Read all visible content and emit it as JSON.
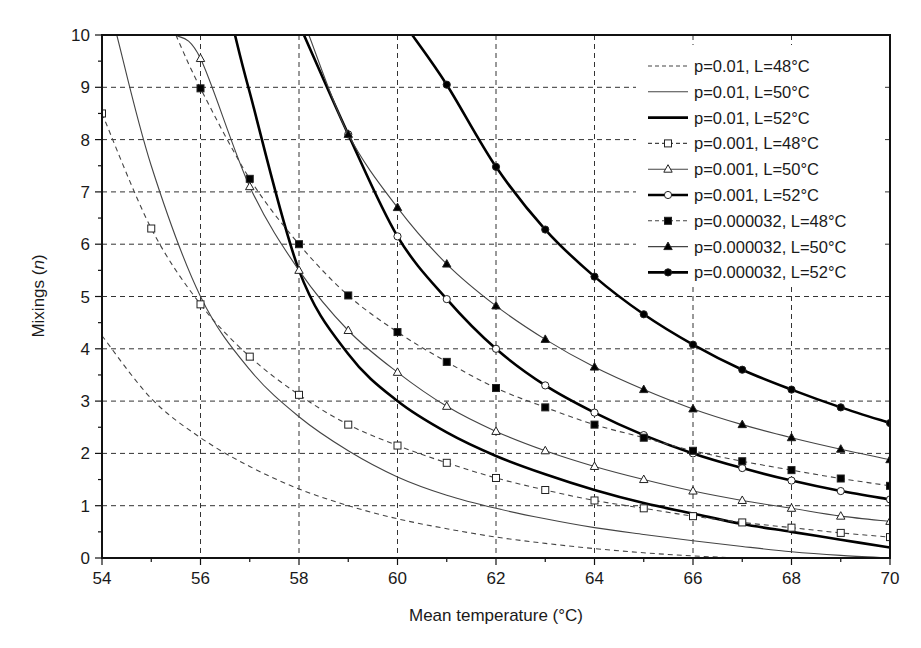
{
  "chart_data": {
    "type": "line",
    "title": "",
    "xlabel": "Mean temperature (°C)",
    "ylabel": "Mixings (n)",
    "xlim": [
      54,
      70
    ],
    "ylim": [
      0,
      10
    ],
    "xticks": [
      54,
      56,
      58,
      60,
      62,
      64,
      66,
      68,
      70
    ],
    "yticks": [
      0,
      1,
      2,
      3,
      4,
      5,
      6,
      7,
      8,
      9,
      10
    ],
    "grid": true,
    "legend_position": "upper right",
    "series": [
      {
        "name": "p=0.01, L=48°C",
        "style": "dashed",
        "weight": "thin",
        "marker": "none",
        "x": [
          54,
          55,
          56,
          57,
          58,
          59,
          60,
          61,
          62,
          63,
          64,
          65,
          66,
          67,
          68,
          69,
          70
        ],
        "y": [
          4.25,
          3.05,
          2.3,
          1.75,
          1.32,
          1.0,
          0.75,
          0.56,
          0.4,
          0.28,
          0.18,
          0.1,
          0.04,
          0.0,
          0.0,
          0.0,
          0.0
        ]
      },
      {
        "name": "p=0.01, L=50°C",
        "style": "solid",
        "weight": "thin",
        "marker": "none",
        "x": [
          54.3,
          55,
          56,
          57,
          58,
          59,
          60,
          61,
          62,
          63,
          64,
          65,
          66,
          67,
          68,
          69,
          70
        ],
        "y": [
          10,
          7.5,
          5.0,
          3.6,
          2.7,
          2.05,
          1.55,
          1.2,
          0.95,
          0.75,
          0.58,
          0.45,
          0.33,
          0.22,
          0.12,
          0.05,
          0.0
        ]
      },
      {
        "name": "p=0.01, L=52°C",
        "style": "solid",
        "weight": "thick",
        "marker": "none",
        "x": [
          56.7,
          57,
          58,
          59,
          60,
          61,
          62,
          63,
          64,
          65,
          66,
          67,
          68,
          69,
          70
        ],
        "y": [
          10,
          8.9,
          5.5,
          3.9,
          3.0,
          2.4,
          1.95,
          1.6,
          1.3,
          1.05,
          0.85,
          0.65,
          0.5,
          0.35,
          0.2
        ]
      },
      {
        "name": "p=0.001, L=48°C",
        "style": "dashed",
        "weight": "thin",
        "marker": "open-square",
        "x": [
          54,
          55,
          56,
          57,
          58,
          59,
          60,
          61,
          62,
          63,
          64,
          65,
          66,
          67,
          68,
          69,
          70
        ],
        "y": [
          8.5,
          6.3,
          4.85,
          3.85,
          3.12,
          2.55,
          2.15,
          1.82,
          1.53,
          1.3,
          1.1,
          0.95,
          0.8,
          0.68,
          0.58,
          0.48,
          0.4
        ]
      },
      {
        "name": "p=0.001, L=50°C",
        "style": "solid",
        "weight": "thin",
        "marker": "open-triangle",
        "x": [
          55.5,
          56,
          57,
          58,
          59,
          60,
          61,
          62,
          63,
          64,
          65,
          66,
          67,
          68,
          69,
          70
        ],
        "y": [
          10,
          9.55,
          7.1,
          5.5,
          4.35,
          3.55,
          2.9,
          2.42,
          2.05,
          1.75,
          1.5,
          1.28,
          1.1,
          0.95,
          0.8,
          0.7
        ]
      },
      {
        "name": "p=0.001, L=52°C",
        "style": "solid",
        "weight": "thick",
        "marker": "open-circle",
        "x": [
          58.1,
          59,
          60,
          61,
          62,
          63,
          64,
          65,
          66,
          67,
          68,
          69,
          70
        ],
        "y": [
          10,
          8.1,
          6.15,
          4.95,
          4.0,
          3.3,
          2.78,
          2.35,
          2.0,
          1.72,
          1.48,
          1.28,
          1.12
        ]
      },
      {
        "name": "p=0.000032, L=48°C",
        "style": "dashed",
        "weight": "thin",
        "marker": "filled-square",
        "x": [
          55.5,
          56,
          57,
          58,
          59,
          60,
          61,
          62,
          63,
          64,
          65,
          66,
          67,
          68,
          69,
          70
        ],
        "y": [
          10,
          8.98,
          7.25,
          6.0,
          5.02,
          4.32,
          3.75,
          3.25,
          2.88,
          2.55,
          2.3,
          2.05,
          1.85,
          1.68,
          1.52,
          1.38
        ]
      },
      {
        "name": "p=0.000032, L=50°C",
        "style": "solid",
        "weight": "thin",
        "marker": "filled-triangle",
        "x": [
          58.2,
          59,
          60,
          61,
          62,
          63,
          64,
          65,
          66,
          67,
          68,
          69,
          70
        ],
        "y": [
          10,
          8.1,
          6.7,
          5.62,
          4.82,
          4.18,
          3.65,
          3.22,
          2.85,
          2.55,
          2.3,
          2.08,
          1.88
        ]
      },
      {
        "name": "p=0.000032, L=52°C",
        "style": "solid",
        "weight": "thick",
        "marker": "filled-circle",
        "x": [
          60.3,
          61,
          62,
          63,
          64,
          65,
          66,
          67,
          68,
          69,
          70
        ],
        "y": [
          10,
          9.05,
          7.48,
          6.28,
          5.38,
          4.66,
          4.08,
          3.6,
          3.22,
          2.88,
          2.58
        ]
      }
    ]
  },
  "markers_at": "integer temperatures"
}
